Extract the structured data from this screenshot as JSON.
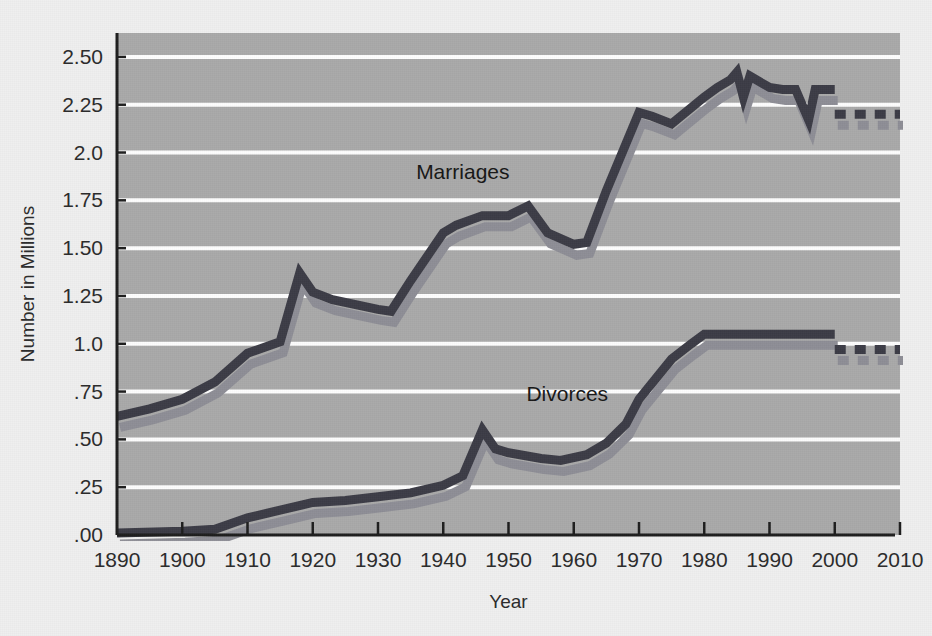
{
  "figure": {
    "background_color": "#efefef",
    "plot_background_color": "#a9a9a9",
    "gridline_color": "#fdfdfd",
    "axis_color": "#1d1d1d"
  },
  "chart_data": {
    "type": "line",
    "title": "",
    "xlabel": "Year",
    "ylabel": "Number in Millions",
    "xlim": [
      1890,
      2010
    ],
    "ylim": [
      0,
      2.625
    ],
    "grid": true,
    "legend_position": "inline-annotations",
    "x_tick_labels": [
      "1890",
      "1900",
      "1910",
      "1920",
      "1930",
      "1940",
      "1950",
      "1960",
      "1970",
      "1980",
      "1990",
      "2000",
      "2010"
    ],
    "x_tick_values": [
      1890,
      1900,
      1910,
      1920,
      1930,
      1940,
      1950,
      1960,
      1970,
      1980,
      1990,
      2000,
      2010
    ],
    "y_tick_labels": [
      ".00",
      ".25",
      ".50",
      ".75",
      "1.0",
      "1.25",
      "1.50",
      "1.75",
      "2.0",
      "2.25",
      "2.50"
    ],
    "y_tick_values": [
      0,
      0.25,
      0.5,
      0.75,
      1.0,
      1.25,
      1.5,
      1.75,
      2.0,
      2.25,
      2.5
    ],
    "series": [
      {
        "name": "Marriages",
        "color": "#3c3c46",
        "shadow_color": "#8e8e96",
        "label_x": 1943,
        "label_y": 1.86,
        "solid": {
          "x": [
            1890,
            1895,
            1900,
            1905,
            1910,
            1915,
            1918,
            1920,
            1923,
            1930,
            1932,
            1935,
            1940,
            1942,
            1946,
            1950,
            1953,
            1956,
            1960,
            1962,
            1965,
            1970,
            1972,
            1975,
            1980,
            1982,
            1984,
            1985,
            1986,
            1987,
            1990,
            1992,
            1994,
            1996,
            1997,
            1998,
            2000
          ],
          "y": [
            0.62,
            0.66,
            0.71,
            0.8,
            0.95,
            1.01,
            1.37,
            1.27,
            1.23,
            1.18,
            1.17,
            1.33,
            1.58,
            1.62,
            1.67,
            1.67,
            1.72,
            1.58,
            1.52,
            1.53,
            1.8,
            2.21,
            2.19,
            2.15,
            2.29,
            2.34,
            2.38,
            2.42,
            2.29,
            2.4,
            2.34,
            2.33,
            2.33,
            2.17,
            2.33,
            2.33,
            2.33
          ]
        },
        "dashed": {
          "x": [
            2000,
            2002,
            2004,
            2006,
            2008,
            2010
          ],
          "y": [
            2.2,
            2.2,
            2.2,
            2.2,
            2.2,
            2.2
          ]
        }
      },
      {
        "name": "Divorces",
        "color": "#3c3c46",
        "shadow_color": "#8e8e96",
        "label_x": 1959,
        "label_y": 0.7,
        "solid": {
          "x": [
            1890,
            1900,
            1905,
            1910,
            1915,
            1920,
            1925,
            1930,
            1935,
            1940,
            1943,
            1946,
            1948,
            1950,
            1955,
            1958,
            1962,
            1965,
            1968,
            1970,
            1975,
            1978,
            1980,
            1985,
            1990,
            1995,
            2000
          ],
          "y": [
            0.01,
            0.02,
            0.03,
            0.09,
            0.13,
            0.17,
            0.18,
            0.2,
            0.22,
            0.26,
            0.31,
            0.55,
            0.45,
            0.43,
            0.4,
            0.39,
            0.42,
            0.48,
            0.58,
            0.71,
            0.92,
            1.0,
            1.05,
            1.05,
            1.05,
            1.05,
            1.05
          ]
        },
        "dashed": {
          "x": [
            2000,
            2002,
            2004,
            2006,
            2008,
            2010
          ],
          "y": [
            0.97,
            0.97,
            0.97,
            0.97,
            0.97,
            0.97
          ]
        }
      }
    ]
  }
}
